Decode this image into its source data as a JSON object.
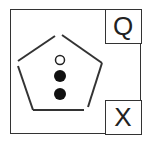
{
  "figure": {
    "corner_labels": {
      "top_right": "Q",
      "bottom_right": "X"
    },
    "shape": "pentagon",
    "dots": [
      {
        "type": "hollow"
      },
      {
        "type": "filled"
      },
      {
        "type": "filled"
      }
    ],
    "colors": {
      "stroke": "#333333",
      "fill": "#111111",
      "background": "#ffffff"
    }
  }
}
